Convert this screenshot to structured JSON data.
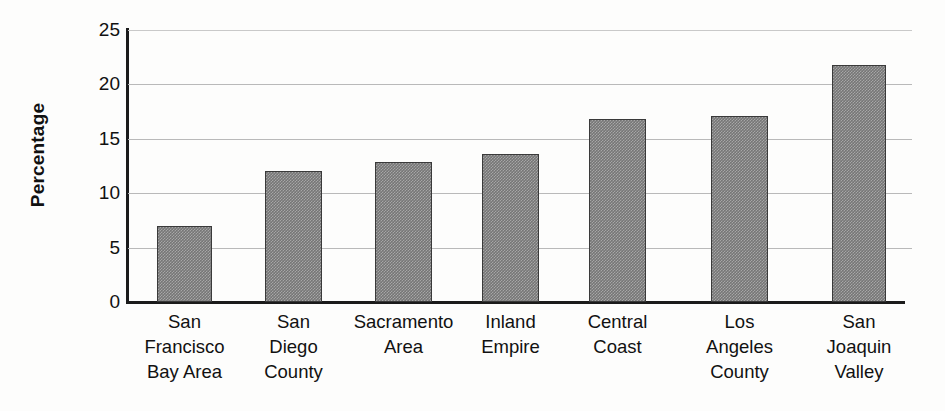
{
  "chart_data": {
    "type": "bar",
    "title": "",
    "xlabel": "",
    "ylabel": "Percentage",
    "ylim": [
      0,
      25
    ],
    "yticks": [
      0,
      5,
      10,
      15,
      20,
      25
    ],
    "ytick_labels": [
      "0",
      "5",
      "10",
      "15",
      "20",
      "25"
    ],
    "grid": true,
    "legend": "none",
    "orientation": "vertical",
    "bar_color": "#767676",
    "bar_edge_color": "#3a3a3a",
    "categories": [
      "San Francisco Bay Area",
      "San Diego County",
      "Sacramento Area",
      "Inland Empire",
      "Central Coast",
      "Los Angeles County",
      "San Joaquin Valley"
    ],
    "category_lines": [
      [
        "San",
        "Francisco",
        "Bay Area"
      ],
      [
        "San",
        "Diego",
        "County"
      ],
      [
        "Sacramento",
        "Area"
      ],
      [
        "Inland",
        "Empire"
      ],
      [
        "Central",
        "Coast"
      ],
      [
        "Los",
        "Angeles",
        "County"
      ],
      [
        "San",
        "Joaquin",
        "Valley"
      ]
    ],
    "values": [
      7.0,
      12.0,
      12.9,
      13.6,
      16.8,
      17.1,
      21.8
    ]
  }
}
